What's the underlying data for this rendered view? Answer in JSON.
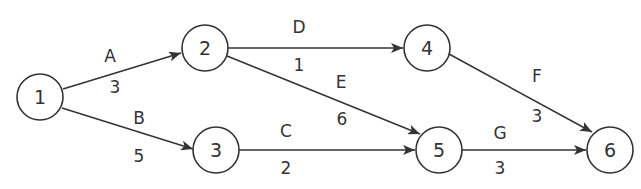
{
  "diagram": {
    "type": "activity-on-arrow network",
    "nodes": [
      {
        "id": "1",
        "label": "1",
        "x": 40,
        "y": 97
      },
      {
        "id": "2",
        "label": "2",
        "x": 205,
        "y": 48
      },
      {
        "id": "3",
        "label": "3",
        "x": 216,
        "y": 150
      },
      {
        "id": "4",
        "label": "4",
        "x": 427,
        "y": 48
      },
      {
        "id": "5",
        "label": "5",
        "x": 439,
        "y": 150
      },
      {
        "id": "6",
        "label": "6",
        "x": 610,
        "y": 150
      }
    ],
    "edges": [
      {
        "from": "1",
        "to": "2",
        "activity": "A",
        "duration": "3"
      },
      {
        "from": "1",
        "to": "3",
        "activity": "B",
        "duration": "5"
      },
      {
        "from": "3",
        "to": "5",
        "activity": "C",
        "duration": "2"
      },
      {
        "from": "2",
        "to": "4",
        "activity": "D",
        "duration": "1"
      },
      {
        "from": "2",
        "to": "5",
        "activity": "E",
        "duration": "6"
      },
      {
        "from": "4",
        "to": "6",
        "activity": "F",
        "duration": "3"
      },
      {
        "from": "5",
        "to": "6",
        "activity": "G",
        "duration": "3"
      }
    ]
  },
  "colors": {
    "stroke": "#333333",
    "background": "#ffffff"
  }
}
